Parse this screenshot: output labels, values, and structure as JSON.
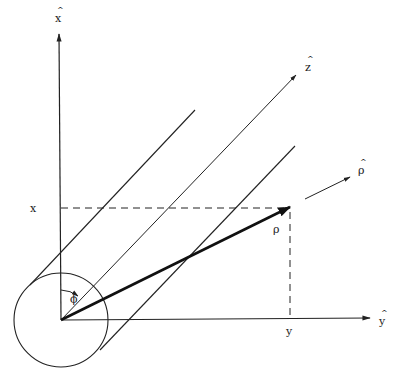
{
  "diagram": {
    "axes": {
      "x": {
        "label": "x",
        "hat": "^"
      },
      "y": {
        "label": "y",
        "hat": "^"
      },
      "z": {
        "label": "z",
        "hat": "^"
      }
    },
    "vectors": {
      "rho": {
        "label": "ρ"
      },
      "rho_hat": {
        "label": "ρ",
        "hat": "^"
      }
    },
    "angle": {
      "label": "ϕ"
    },
    "projections": {
      "x_label": "x",
      "y_label": "y"
    },
    "colors": {
      "line": "#222222",
      "background": "#ffffff"
    }
  }
}
